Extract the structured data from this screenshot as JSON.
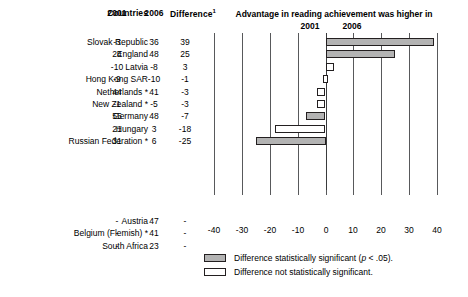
{
  "table": {
    "headers": {
      "countries": "Countries",
      "y2001": "2001",
      "y2006": "2006",
      "difference": "Difference",
      "difference_superscript": "1"
    },
    "rows": [
      {
        "country": "Slovak Republic",
        "v2001": "-3",
        "v2006": "36",
        "diff": "39"
      },
      {
        "country": "England",
        "v2001": "24",
        "v2006": "48",
        "diff": "25"
      },
      {
        "country": "Latvia",
        "v2001": "-10",
        "v2006": "-8",
        "diff": "3"
      },
      {
        "country": "Hong Kong SAR",
        "v2001": "-9",
        "v2006": "-10",
        "diff": "-1"
      },
      {
        "country": "Netherlands *",
        "v2001": "44",
        "v2006": "41",
        "diff": "-3"
      },
      {
        "country": "New Zealand *",
        "v2001": "-1",
        "v2006": "-5",
        "diff": "-3"
      },
      {
        "country": "Germany",
        "v2001": "55",
        "v2006": "48",
        "diff": "-7"
      },
      {
        "country": "Hungary",
        "v2001": "21",
        "v2006": "3",
        "diff": "-18"
      },
      {
        "country": "Russian Federation *",
        "v2001": "31",
        "v2006": "6",
        "diff": "-25"
      }
    ],
    "rows_nochart": [
      {
        "country": "Austria",
        "v2001": "-",
        "v2006": "47",
        "diff": "-"
      },
      {
        "country": "Belgium (Flemish) *",
        "v2001": "-",
        "v2006": "41",
        "diff": "-"
      },
      {
        "country": "South Africa",
        "v2001": "-",
        "v2006": "23",
        "diff": "-"
      }
    ]
  },
  "chart_data": {
    "type": "bar",
    "orientation": "horizontal",
    "title": "Advantage in reading achievement was higher in",
    "side_label_left": "2001",
    "side_label_right": "2006",
    "xlabel": "",
    "ylabel": "",
    "xlim": [
      -40,
      40
    ],
    "xticks": [
      -40,
      -30,
      -20,
      -10,
      0,
      10,
      20,
      30,
      40
    ],
    "xticklabels": [
      "-40",
      "-30",
      "-20",
      "-10",
      "0",
      "10",
      "20",
      "30",
      "40"
    ],
    "grid": true,
    "categories": [
      "Slovak Republic",
      "England",
      "Latvia",
      "Hong Kong SAR",
      "Netherlands *",
      "New Zealand *",
      "Germany",
      "Hungary",
      "Russian Federation *"
    ],
    "values": [
      39,
      25,
      3,
      -1,
      -3,
      -3,
      -7,
      -18,
      -25
    ],
    "significance": [
      "significant",
      "significant",
      "not-significant",
      "not-significant",
      "not-significant",
      "not-significant",
      "significant",
      "not-significant",
      "significant"
    ]
  },
  "legend": {
    "position": "bottom",
    "items": [
      {
        "style": "significant",
        "label_pre": "Difference statistically significant (",
        "label_italic": "p",
        "label_post": " < .05)."
      },
      {
        "style": "not-significant",
        "label_pre": "Difference not statistically significant.",
        "label_italic": "",
        "label_post": ""
      }
    ]
  },
  "colors": {
    "significant_fill": "#b3b3b3",
    "not_significant_fill": "#ffffff",
    "bar_border": "#231f20",
    "gridline": "#58595b"
  }
}
